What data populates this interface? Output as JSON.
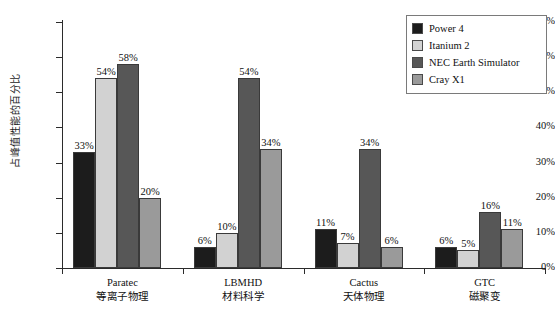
{
  "chart_data": {
    "type": "bar",
    "title": "",
    "xlabel": "",
    "ylabel": "占峰值性能的百分比",
    "ylim": [
      0,
      70
    ],
    "ytick_labels": [
      "0%",
      "10%",
      "20%",
      "30%",
      "40%",
      "50%",
      "60%",
      "70%"
    ],
    "ytick_values": [
      0,
      10,
      20,
      30,
      40,
      50,
      60,
      70
    ],
    "grid": false,
    "legend_position": "top-right",
    "value_suffix": "%",
    "categories": [
      "Paratec",
      "LBMHD",
      "Cactus",
      "GTC"
    ],
    "category_sublabels": [
      "等离子物理",
      "材料科学",
      "天体物理",
      "磁聚变"
    ],
    "series": [
      {
        "name": "Power 4",
        "color": "#1c1c1c",
        "values": [
          33,
          6,
          11,
          6
        ]
      },
      {
        "name": "Itanium 2",
        "color": "#d2d2d2",
        "values": [
          54,
          10,
          7,
          5
        ]
      },
      {
        "name": "NEC Earth Simulator",
        "color": "#575757",
        "values": [
          58,
          54,
          34,
          16
        ]
      },
      {
        "name": "Cray X1",
        "color": "#9a9a9a",
        "values": [
          20,
          34,
          6,
          11
        ]
      }
    ],
    "data_labels": [
      [
        "33%",
        "54%",
        "58%",
        "20%"
      ],
      [
        "6%",
        "10%",
        "54%",
        "34%"
      ],
      [
        "11%",
        "7%",
        "34%",
        "6%"
      ],
      [
        "6%",
        "5%",
        "16%",
        "11%"
      ]
    ]
  },
  "legend": {
    "items": [
      {
        "label": "Power 4",
        "color": "#1c1c1c"
      },
      {
        "label": "Itanium 2",
        "color": "#d2d2d2"
      },
      {
        "label": "NEC Earth Simulator",
        "color": "#575757"
      },
      {
        "label": "Cray X1",
        "color": "#9a9a9a"
      }
    ]
  },
  "axes": {
    "y_title": "占峰值性能的百分比",
    "y_ticks": [
      "70%",
      "60%",
      "50%",
      "40%",
      "30%",
      "20%",
      "10%",
      "0%"
    ]
  }
}
